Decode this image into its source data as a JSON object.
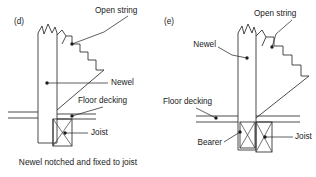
{
  "figure": {
    "background_color": "#ffffff",
    "ink_color": "#2b2b2b",
    "panels": [
      {
        "key": "d",
        "label": "(d)",
        "caption": "Newel notched and fixed to joist",
        "labels": {
          "open_string": "Open string",
          "newel": "Newel",
          "floor_decking": "Floor decking",
          "joist": "Joist"
        }
      },
      {
        "key": "e",
        "label": "(e)",
        "caption": "",
        "labels": {
          "open_string": "Open string",
          "newel": "Newel",
          "floor_decking": "Floor decking",
          "joist": "Joist",
          "bearer": "Bearer"
        }
      }
    ]
  }
}
